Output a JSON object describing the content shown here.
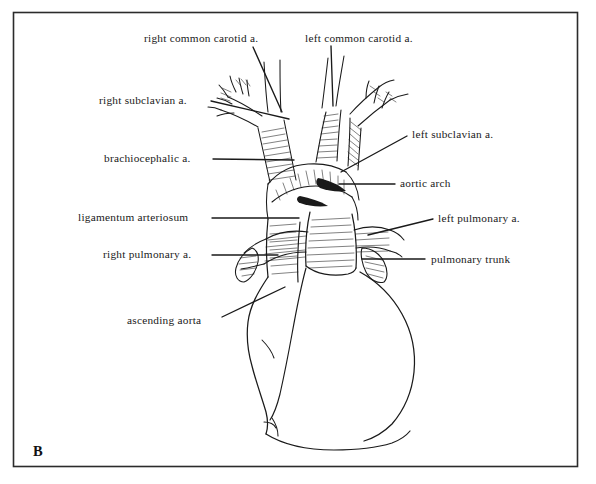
{
  "figure": {
    "panel_letter": "B",
    "frame": {
      "x": 13,
      "y": 12,
      "width": 565,
      "height": 455,
      "color": "#2b2b2b"
    },
    "background_color": "#ffffff",
    "ink_color": "#1a1a1a"
  },
  "labels": [
    {
      "id": "right-common-carotid",
      "text": "right common carotid a.",
      "side": "top",
      "text_x": 144,
      "text_y": 33,
      "leader": {
        "x1": 253,
        "y1": 47,
        "x2": 282,
        "y2": 112
      }
    },
    {
      "id": "left-common-carotid",
      "text": "left common carotid a.",
      "side": "top",
      "text_x": 305,
      "text_y": 33,
      "leader": {
        "x1": 331,
        "y1": 46,
        "x2": 333,
        "y2": 106
      }
    },
    {
      "id": "right-subclavian",
      "text": "right subclavian a.",
      "side": "left",
      "text_x": 99,
      "text_y": 95,
      "leader": {
        "x1": 211,
        "y1": 101,
        "x2": 289,
        "y2": 119
      }
    },
    {
      "id": "brachiocephalic",
      "text": "brachiocephalic a.",
      "side": "left",
      "text_x": 104,
      "text_y": 153,
      "leader": {
        "x1": 213,
        "y1": 159,
        "x2": 294,
        "y2": 160
      }
    },
    {
      "id": "ligamentum-arteriosum",
      "text": "ligamentum arteriosum",
      "side": "left",
      "text_x": 78,
      "text_y": 212,
      "leader": {
        "x1": 212,
        "y1": 218,
        "x2": 299,
        "y2": 218
      }
    },
    {
      "id": "right-pulmonary",
      "text": "right pulmonary a.",
      "side": "left",
      "text_x": 103,
      "text_y": 249,
      "leader": {
        "x1": 212,
        "y1": 255,
        "x2": 278,
        "y2": 255
      }
    },
    {
      "id": "ascending-aorta",
      "text": "ascending aorta",
      "side": "left",
      "text_x": 127,
      "text_y": 315,
      "leader": {
        "x1": 222,
        "y1": 317,
        "x2": 285,
        "y2": 287
      }
    },
    {
      "id": "left-subclavian",
      "text": "left subclavian a.",
      "side": "right",
      "text_x": 412,
      "text_y": 129,
      "leader": {
        "x1": 407,
        "y1": 136,
        "x2": 341,
        "y2": 172
      }
    },
    {
      "id": "aortic-arch",
      "text": "aortic arch",
      "side": "right",
      "text_x": 400,
      "text_y": 178,
      "leader": {
        "x1": 395,
        "y1": 184,
        "x2": 339,
        "y2": 184
      }
    },
    {
      "id": "left-pulmonary",
      "text": "left pulmonary a.",
      "side": "right",
      "text_x": 438,
      "text_y": 213,
      "leader": {
        "x1": 433,
        "y1": 219,
        "x2": 368,
        "y2": 235
      }
    },
    {
      "id": "pulmonary-trunk",
      "text": "pulmonary trunk",
      "side": "right",
      "text_x": 431,
      "text_y": 254,
      "leader": {
        "x1": 425,
        "y1": 259,
        "x2": 362,
        "y2": 259
      }
    }
  ]
}
